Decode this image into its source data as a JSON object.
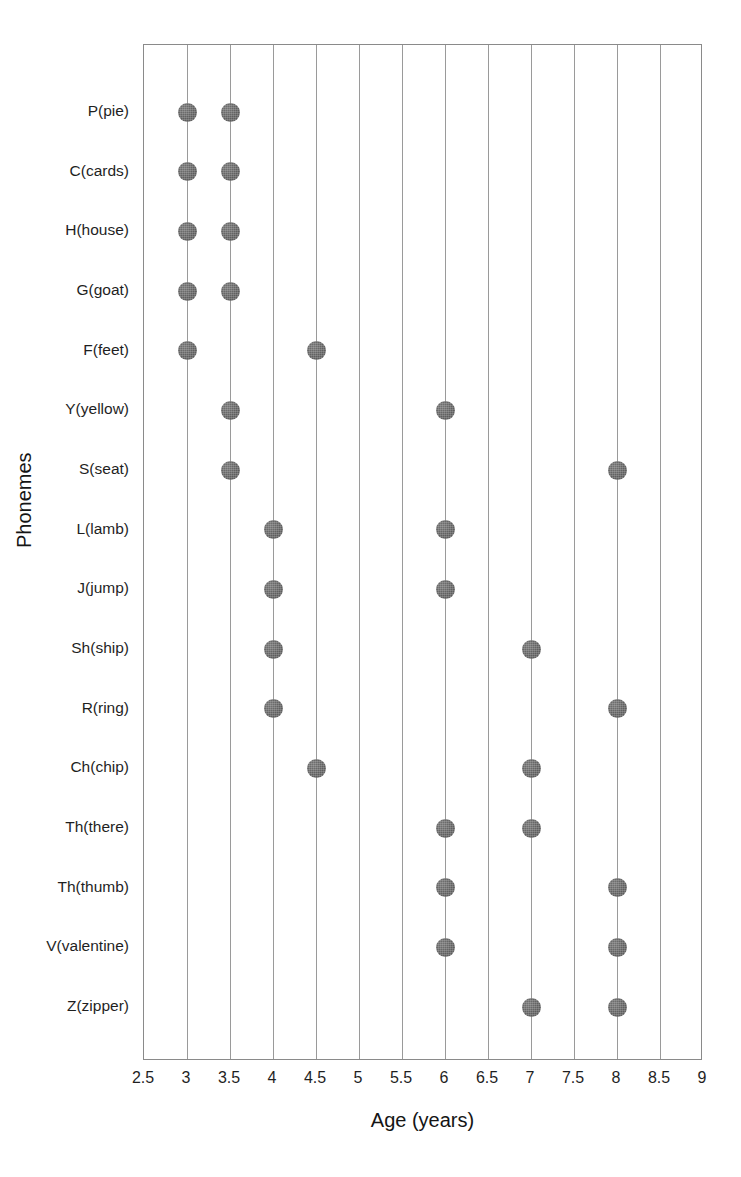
{
  "chart_data": {
    "type": "scatter",
    "title": "",
    "xlabel": "Age (years)",
    "ylabel": "Phonemes",
    "xlim": [
      2.5,
      9
    ],
    "ylim_categories_top_to_bottom": true,
    "grid": "vertical",
    "legend": "none",
    "xticks": [
      "2.5",
      "3",
      "3.5",
      "4",
      "4.5",
      "5",
      "5.5",
      "6",
      "6.5",
      "7",
      "7.5",
      "8",
      "8.5",
      "9"
    ],
    "xtick_values": [
      2.5,
      3,
      3.5,
      4,
      4.5,
      5,
      5.5,
      6,
      6.5,
      7,
      7.5,
      8,
      8.5,
      9
    ],
    "categories": [
      "P(pie)",
      "C(cards)",
      "H(house)",
      "G(goat)",
      "F(feet)",
      "Y(yellow)",
      "S(seat)",
      "L(lamb)",
      "J(jump)",
      "Sh(ship)",
      "R(ring)",
      "Ch(chip)",
      "Th(there)",
      "Th(thumb)",
      "V(valentine)",
      "Z(zipper)"
    ],
    "points": [
      {
        "category": "P(pie)",
        "values": [
          3,
          3.5
        ]
      },
      {
        "category": "C(cards)",
        "values": [
          3,
          3.5
        ]
      },
      {
        "category": "H(house)",
        "values": [
          3,
          3.5
        ]
      },
      {
        "category": "G(goat)",
        "values": [
          3,
          3.5
        ]
      },
      {
        "category": "F(feet)",
        "values": [
          3,
          4.5
        ]
      },
      {
        "category": "Y(yellow)",
        "values": [
          3.5,
          6
        ]
      },
      {
        "category": "S(seat)",
        "values": [
          3.5,
          8
        ]
      },
      {
        "category": "L(lamb)",
        "values": [
          4,
          6
        ]
      },
      {
        "category": "J(jump)",
        "values": [
          4,
          6
        ]
      },
      {
        "category": "Sh(ship)",
        "values": [
          4,
          7
        ]
      },
      {
        "category": "R(ring)",
        "values": [
          4,
          8
        ]
      },
      {
        "category": "Ch(chip)",
        "values": [
          4.5,
          7
        ]
      },
      {
        "category": "Th(there)",
        "values": [
          6,
          7
        ]
      },
      {
        "category": "Th(thumb)",
        "values": [
          6,
          8
        ]
      },
      {
        "category": "V(valentine)",
        "values": [
          6,
          8
        ]
      },
      {
        "category": "Z(zipper)",
        "values": [
          7,
          8
        ]
      }
    ],
    "series": [
      {
        "name": "Onset of acquisition",
        "values": [
          3,
          3,
          3,
          3,
          3,
          3.5,
          3.5,
          4,
          4,
          4,
          4,
          4.5,
          6,
          6,
          6,
          7
        ]
      },
      {
        "name": "Mastery age",
        "values": [
          3.5,
          3.5,
          3.5,
          3.5,
          4.5,
          6,
          8,
          6,
          6,
          7,
          8,
          7,
          7,
          8,
          8,
          8
        ]
      }
    ],
    "colors": {
      "marker": "#5d5d5d",
      "gridline": "#9a9a9a",
      "axis": "#8a8a8a",
      "text": "#1f1f1f",
      "background": "#ffffff"
    }
  }
}
